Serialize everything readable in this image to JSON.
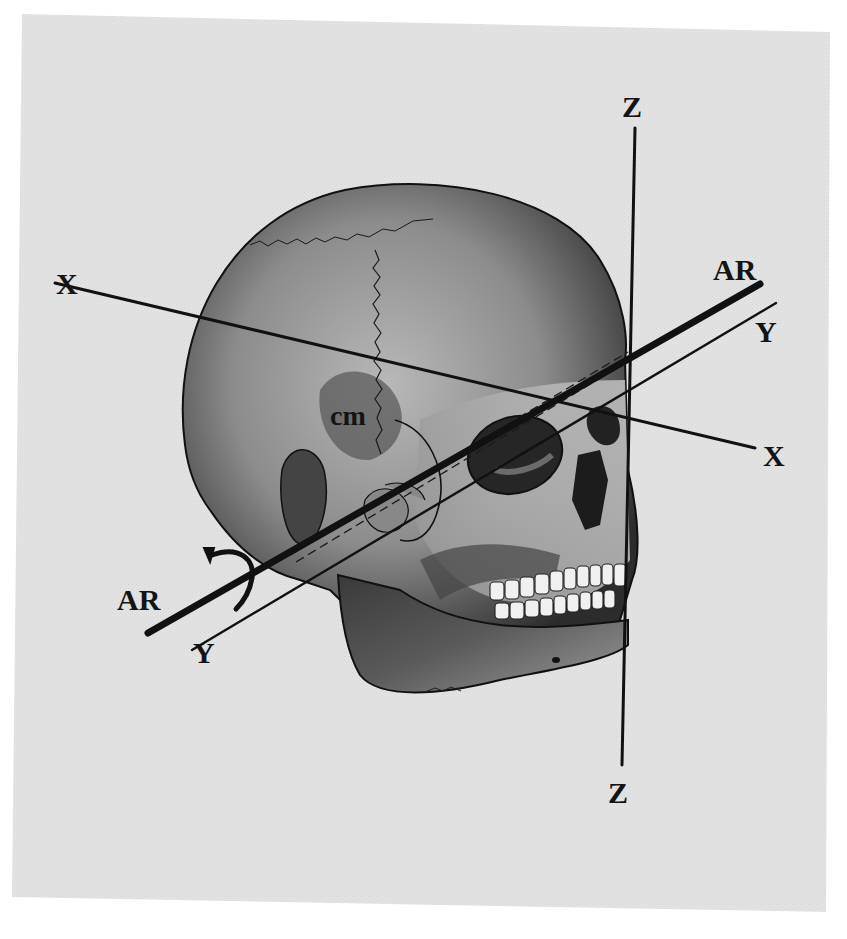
{
  "figure": {
    "background_color": "#e4e4e4",
    "ink_color": "#141414",
    "axes": [
      {
        "id": "x",
        "label_start": "X",
        "label_end": "X",
        "style": "solid-medium"
      },
      {
        "id": "y",
        "label_start": "Y",
        "label_end": "Y",
        "style": "solid-thin"
      },
      {
        "id": "z",
        "label_start": "Z",
        "label_end": "Z",
        "style": "solid-medium"
      },
      {
        "id": "ar",
        "label_start": "AR",
        "label_end": "AR",
        "style": "solid-thick"
      }
    ],
    "center_label": "cm",
    "rotation_arrow": "curved-arrow-around-AR-axis"
  }
}
